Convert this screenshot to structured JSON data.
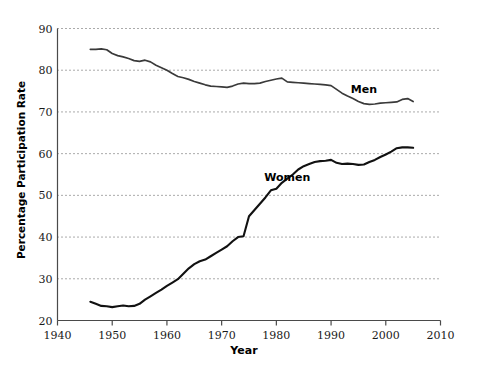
{
  "chart_data": {
    "type": "line",
    "title": "",
    "xlabel": "Year",
    "ylabel": "Percentage Participation Rate",
    "xlim": [
      1940,
      2010
    ],
    "ylim": [
      20,
      90
    ],
    "xticks": [
      1940,
      1950,
      1960,
      1970,
      1980,
      1990,
      2000,
      2010
    ],
    "yticks": [
      20,
      30,
      40,
      50,
      60,
      70,
      80,
      90
    ],
    "grid": "horizontal-dotted",
    "legend": "inline-labels",
    "series": [
      {
        "name": "Men",
        "color": "#3a3a3a",
        "label_x": 1996,
        "label_y": 75.5,
        "x": [
          1946,
          1947,
          1948,
          1949,
          1950,
          1951,
          1952,
          1953,
          1954,
          1955,
          1956,
          1957,
          1958,
          1959,
          1960,
          1961,
          1962,
          1963,
          1964,
          1965,
          1966,
          1967,
          1968,
          1969,
          1970,
          1971,
          1972,
          1973,
          1974,
          1975,
          1976,
          1977,
          1978,
          1979,
          1980,
          1981,
          1982,
          1983,
          1984,
          1985,
          1986,
          1987,
          1988,
          1989,
          1990,
          1991,
          1992,
          1993,
          1994,
          1995,
          1996,
          1997,
          1998,
          1999,
          2000,
          2001,
          2002,
          2003,
          2004,
          2005
        ],
        "values": [
          85.0,
          85.0,
          85.1,
          84.9,
          84.0,
          83.5,
          83.2,
          82.8,
          82.3,
          82.1,
          82.4,
          82.0,
          81.2,
          80.6,
          80.0,
          79.2,
          78.5,
          78.2,
          77.8,
          77.3,
          76.9,
          76.5,
          76.2,
          76.1,
          76.0,
          75.9,
          76.2,
          76.7,
          76.9,
          76.8,
          76.8,
          76.9,
          77.3,
          77.6,
          77.9,
          78.1,
          77.2,
          77.1,
          77.0,
          76.9,
          76.8,
          76.7,
          76.6,
          76.5,
          76.3,
          75.4,
          74.5,
          73.8,
          73.2,
          72.5,
          72.0,
          71.8,
          71.9,
          72.1,
          72.2,
          72.3,
          72.4,
          73.0,
          73.2,
          72.5
        ]
      },
      {
        "name": "Women",
        "color": "#111111",
        "label_x": 1982,
        "label_y": 54.5,
        "x": [
          1946,
          1947,
          1948,
          1949,
          1950,
          1951,
          1952,
          1953,
          1954,
          1955,
          1956,
          1957,
          1958,
          1959,
          1960,
          1961,
          1962,
          1963,
          1964,
          1965,
          1966,
          1967,
          1968,
          1969,
          1970,
          1971,
          1972,
          1973,
          1974,
          1975,
          1976,
          1977,
          1978,
          1979,
          1980,
          1981,
          1982,
          1983,
          1984,
          1985,
          1986,
          1987,
          1988,
          1989,
          1990,
          1991,
          1992,
          1993,
          1994,
          1995,
          1996,
          1997,
          1998,
          1999,
          2000,
          2001,
          2002,
          2003,
          2004,
          2005
        ],
        "values": [
          24.5,
          24.0,
          23.5,
          23.4,
          23.2,
          23.4,
          23.6,
          23.4,
          23.5,
          24.0,
          25.0,
          25.8,
          26.6,
          27.4,
          28.3,
          29.1,
          29.9,
          31.2,
          32.5,
          33.5,
          34.2,
          34.6,
          35.4,
          36.2,
          37.0,
          37.8,
          39.0,
          40.0,
          40.2,
          45.0,
          46.5,
          48.0,
          49.5,
          51.2,
          51.6,
          53.0,
          54.0,
          55.0,
          56.2,
          57.0,
          57.5,
          58.0,
          58.2,
          58.3,
          58.5,
          57.8,
          57.5,
          57.6,
          57.5,
          57.3,
          57.4,
          58.0,
          58.5,
          59.2,
          59.8,
          60.5,
          61.3,
          61.5,
          61.5,
          61.4
        ]
      }
    ]
  },
  "axis": {
    "x_tick_labels": [
      "1940",
      "1950",
      "1960",
      "1970",
      "1980",
      "1990",
      "2000",
      "2010"
    ],
    "y_tick_labels": [
      "20",
      "30",
      "40",
      "50",
      "60",
      "70",
      "80",
      "90"
    ],
    "x_title": "Year",
    "y_title": "Percentage Participation Rate"
  },
  "labels": {
    "men": "Men",
    "women": "Women"
  },
  "colors": {
    "background": "#ffffff",
    "axis": "#4a4a4a",
    "gridline": "#555555",
    "men_line": "#3a3a3a",
    "women_line": "#111111",
    "text": "#000000"
  }
}
